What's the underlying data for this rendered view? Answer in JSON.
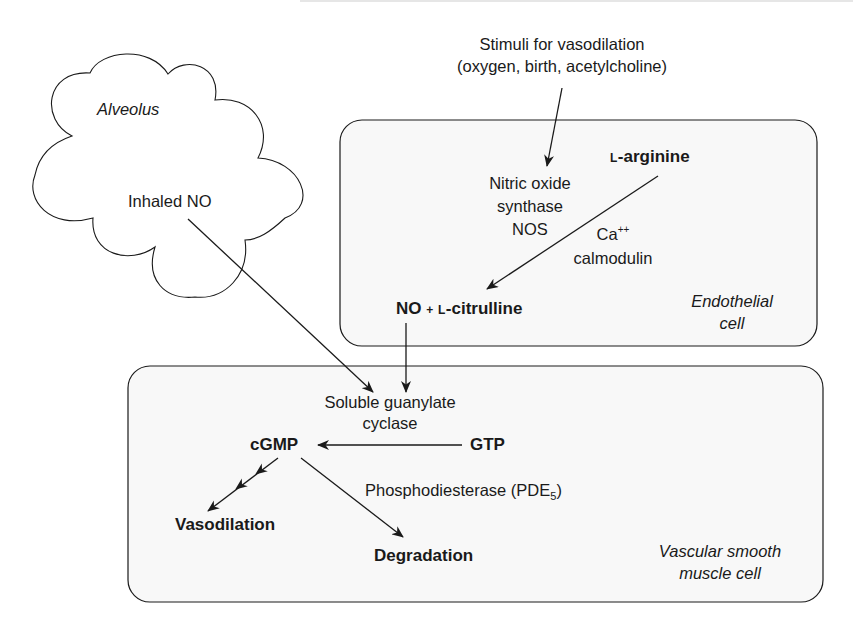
{
  "diagram": {
    "stimuli": {
      "line1": "Stimuli for vasodilation",
      "line2": "(oxygen, birth, acetylcholine)"
    },
    "alveolus": {
      "label": "Alveolus",
      "inhaled": "Inhaled NO"
    },
    "endothelial": {
      "label_line1": "Endothelial",
      "label_line2": "cell",
      "l_arginine_prefix": "L",
      "l_arginine_name": "-arginine",
      "nos_line1": "Nitric oxide",
      "nos_line2": "synthase",
      "nos_line3": "NOS",
      "ca": "Ca",
      "ca_sup": "++",
      "calmodulin": "calmodulin",
      "product_no": "NO",
      "product_plus": "+",
      "product_l_prefix": "L",
      "product_citrulline": "-citrulline"
    },
    "smooth_muscle": {
      "label_line1": "Vascular smooth",
      "label_line2": "muscle cell",
      "sgc_line1": "Soluble guanylate",
      "sgc_line2": "cyclase",
      "cgmp": "cGMP",
      "gtp": "GTP",
      "pde": "Phosphodiesterase (PDE",
      "pde_sub": "5",
      "pde_close": ")",
      "vasodilation": "Vasodilation",
      "degradation": "Degradation"
    }
  },
  "colors": {
    "line": "#1a1a1a",
    "box_fill": "#f8f8f8",
    "background": "#ffffff"
  }
}
